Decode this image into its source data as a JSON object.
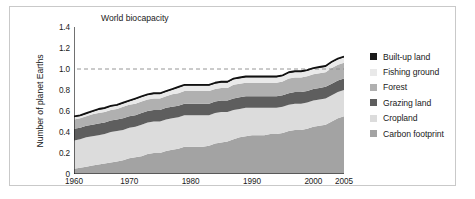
{
  "chart_data": {
    "type": "area",
    "stacked": true,
    "title": "",
    "xlabel": "",
    "ylabel": "Number of planet Earths",
    "xlim": [
      1961,
      2005
    ],
    "ylim": [
      0,
      1.4
    ],
    "xticks": [
      "1960",
      "1970",
      "1980",
      "1990",
      "2000",
      "2005"
    ],
    "xtick_values": [
      1960,
      1970,
      1980,
      1990,
      2000,
      2005
    ],
    "yticks": [
      "0",
      "0.2",
      "0.4",
      "0.6",
      "0.8",
      "1.0",
      "1.2",
      "1.4"
    ],
    "ytick_values": [
      0,
      0.2,
      0.4,
      0.6,
      0.8,
      1.0,
      1.2,
      1.4
    ],
    "grid": false,
    "legend_position": "right",
    "annotations": [
      {
        "text": "World biocapacity",
        "y": 1.0,
        "type": "dashed-reference-line"
      }
    ],
    "x": [
      1961,
      1962,
      1963,
      1964,
      1965,
      1966,
      1967,
      1968,
      1969,
      1970,
      1971,
      1972,
      1973,
      1974,
      1975,
      1976,
      1977,
      1978,
      1979,
      1980,
      1981,
      1982,
      1983,
      1984,
      1985,
      1986,
      1987,
      1988,
      1989,
      1990,
      1991,
      1992,
      1993,
      1994,
      1995,
      1996,
      1997,
      1998,
      1999,
      2000,
      2001,
      2002,
      2003,
      2004,
      2005
    ],
    "series": [
      {
        "name": "Carbon footprint",
        "color": "#a3a3a3",
        "values": [
          0.05,
          0.06,
          0.07,
          0.08,
          0.09,
          0.1,
          0.11,
          0.12,
          0.13,
          0.15,
          0.16,
          0.17,
          0.19,
          0.2,
          0.2,
          0.22,
          0.23,
          0.24,
          0.26,
          0.26,
          0.26,
          0.26,
          0.27,
          0.29,
          0.3,
          0.31,
          0.33,
          0.35,
          0.36,
          0.37,
          0.37,
          0.37,
          0.38,
          0.38,
          0.39,
          0.41,
          0.42,
          0.42,
          0.43,
          0.45,
          0.46,
          0.47,
          0.5,
          0.53,
          0.55
        ]
      },
      {
        "name": "Cropland",
        "color": "#dcdcdc",
        "values": [
          0.27,
          0.27,
          0.28,
          0.28,
          0.28,
          0.28,
          0.29,
          0.29,
          0.29,
          0.29,
          0.29,
          0.3,
          0.3,
          0.3,
          0.3,
          0.3,
          0.3,
          0.3,
          0.3,
          0.3,
          0.3,
          0.3,
          0.29,
          0.29,
          0.29,
          0.28,
          0.28,
          0.27,
          0.27,
          0.26,
          0.26,
          0.26,
          0.25,
          0.25,
          0.25,
          0.25,
          0.25,
          0.25,
          0.25,
          0.25,
          0.25,
          0.25,
          0.25,
          0.25,
          0.25
        ]
      },
      {
        "name": "Grazing land",
        "color": "#5e5e5e",
        "values": [
          0.11,
          0.11,
          0.11,
          0.11,
          0.11,
          0.11,
          0.11,
          0.11,
          0.11,
          0.11,
          0.11,
          0.11,
          0.11,
          0.11,
          0.11,
          0.11,
          0.11,
          0.11,
          0.11,
          0.11,
          0.11,
          0.11,
          0.11,
          0.11,
          0.11,
          0.11,
          0.11,
          0.11,
          0.11,
          0.11,
          0.11,
          0.11,
          0.11,
          0.11,
          0.11,
          0.11,
          0.11,
          0.11,
          0.11,
          0.11,
          0.11,
          0.11,
          0.11,
          0.11,
          0.11
        ]
      },
      {
        "name": "Forest",
        "color": "#b0b0b0",
        "values": [
          0.09,
          0.09,
          0.09,
          0.1,
          0.1,
          0.1,
          0.1,
          0.1,
          0.11,
          0.11,
          0.11,
          0.11,
          0.11,
          0.11,
          0.11,
          0.11,
          0.12,
          0.12,
          0.12,
          0.12,
          0.12,
          0.12,
          0.12,
          0.12,
          0.12,
          0.12,
          0.13,
          0.13,
          0.13,
          0.13,
          0.13,
          0.13,
          0.13,
          0.13,
          0.13,
          0.14,
          0.14,
          0.14,
          0.14,
          0.14,
          0.14,
          0.14,
          0.15,
          0.15,
          0.15
        ]
      },
      {
        "name": "Fishing ground",
        "color": "#e9e9e9",
        "values": [
          0.02,
          0.02,
          0.02,
          0.02,
          0.03,
          0.03,
          0.03,
          0.03,
          0.03,
          0.03,
          0.04,
          0.04,
          0.04,
          0.04,
          0.04,
          0.04,
          0.04,
          0.05,
          0.05,
          0.05,
          0.05,
          0.05,
          0.05,
          0.05,
          0.05,
          0.05,
          0.05,
          0.05,
          0.05,
          0.05,
          0.05,
          0.05,
          0.05,
          0.05,
          0.05,
          0.05,
          0.05,
          0.05,
          0.05,
          0.05,
          0.05,
          0.05,
          0.05,
          0.05,
          0.05
        ]
      },
      {
        "name": "Built-up land",
        "color": "#1a1a1a",
        "values": [
          0.01,
          0.01,
          0.01,
          0.01,
          0.01,
          0.01,
          0.01,
          0.01,
          0.01,
          0.01,
          0.01,
          0.01,
          0.01,
          0.01,
          0.01,
          0.01,
          0.01,
          0.01,
          0.01,
          0.01,
          0.01,
          0.01,
          0.01,
          0.01,
          0.01,
          0.01,
          0.01,
          0.01,
          0.01,
          0.01,
          0.01,
          0.01,
          0.01,
          0.01,
          0.01,
          0.01,
          0.01,
          0.01,
          0.01,
          0.01,
          0.01,
          0.01,
          0.01,
          0.01,
          0.01
        ]
      }
    ],
    "legend": [
      {
        "label": "Built-up land",
        "color": "#1a1a1a"
      },
      {
        "label": "Fishing ground",
        "color": "#e9e9e9"
      },
      {
        "label": "Forest",
        "color": "#b0b0b0"
      },
      {
        "label": "Grazing land",
        "color": "#5e5e5e"
      },
      {
        "label": "Cropland",
        "color": "#dcdcdc"
      },
      {
        "label": "Carbon footprint",
        "color": "#a3a3a3"
      }
    ]
  }
}
